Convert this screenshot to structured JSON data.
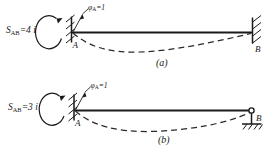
{
  "figure": {
    "panels": [
      {
        "id": "a",
        "caption": "(a)",
        "stiffness_symbol": "S",
        "stiffness_subscript": "AB",
        "stiffness_value": "=4 i",
        "stiffness_full": "S_AB = 4i",
        "rotation_symbol": "φ",
        "rotation_subscript": "A",
        "rotation_value": "=1",
        "rotation_full": "φ_A = 1",
        "node_left": "A",
        "node_right": "B",
        "support_left": "fixed",
        "support_right": "fixed",
        "moment_direction": "counter-clockwise"
      },
      {
        "id": "b",
        "caption": "(b)",
        "stiffness_symbol": "S",
        "stiffness_subscript": "AB",
        "stiffness_value": "=3 i",
        "stiffness_full": "S_AB = 3i",
        "rotation_symbol": "φ",
        "rotation_subscript": "A",
        "rotation_value": "=1",
        "rotation_full": "φ_A = 1",
        "node_left": "A",
        "node_right": "B",
        "support_left": "fixed",
        "support_right": "pinned",
        "moment_direction": "counter-clockwise"
      }
    ],
    "colors": {
      "ink": "#1a1a1a",
      "background": "#ffffff",
      "deflection": "#2a2a2a"
    }
  }
}
